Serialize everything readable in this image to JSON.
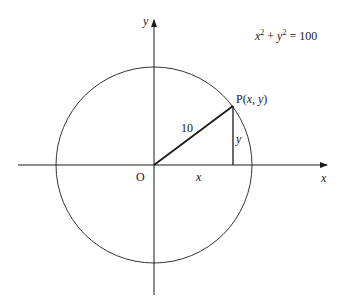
{
  "diagram": {
    "equation": {
      "x_var": "x",
      "y_var": "y",
      "exponent": "2",
      "plus": "+",
      "equals": "=",
      "rhs": "100"
    },
    "axes": {
      "x_label": "x",
      "y_label": "y",
      "origin_label": "O"
    },
    "point": {
      "label_prefix": "P(",
      "x": "x",
      "comma": ", ",
      "y": "y",
      "label_suffix": ")"
    },
    "radius_label": "10",
    "horizontal_leg_label": "x",
    "vertical_leg_label": "y",
    "geometry": {
      "origin": [
        154,
        165
      ],
      "radius_px": 98,
      "point_px": [
        233,
        106
      ]
    },
    "colors": {
      "stroke": "#1a1a1a",
      "circle": "#333333",
      "background": "#ffffff"
    }
  }
}
